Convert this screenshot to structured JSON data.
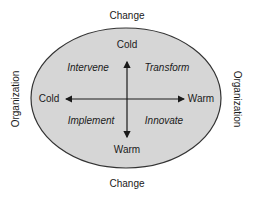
{
  "diagram": {
    "outer_labels": {
      "top": "Change",
      "bottom": "Change",
      "left": "Organization",
      "right": "Organization"
    },
    "axis_labels": {
      "vertical_top": "Cold",
      "vertical_bottom": "Warm",
      "horizontal_left": "Cold",
      "horizontal_right": "Warm"
    },
    "quadrants": {
      "top_left": "Intervene",
      "top_right": "Transform",
      "bottom_left": "Implement",
      "bottom_right": "Innovate"
    },
    "colors": {
      "ellipse_fill": "#d6d6d6",
      "ellipse_stroke": "#333333",
      "arrow": "#1a1a1a"
    }
  }
}
